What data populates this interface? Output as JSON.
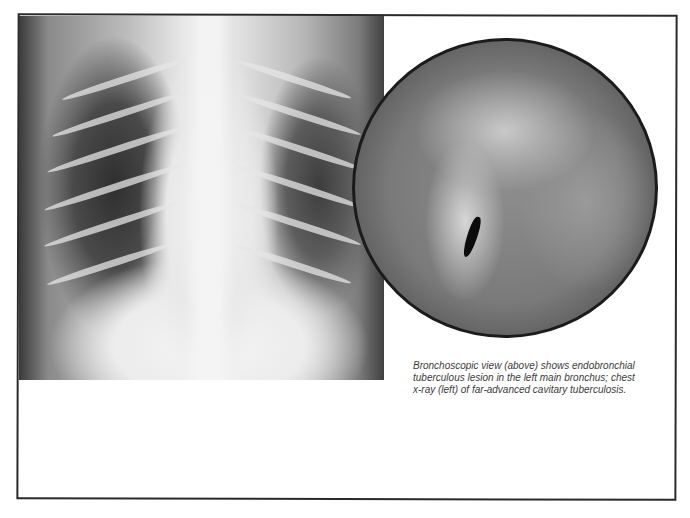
{
  "figure": {
    "left_image": {
      "label": "chest x-ray",
      "description": "Frontal chest radiograph showing far-advanced cavitary tuberculosis"
    },
    "right_image": {
      "label": "bronchoscopic view",
      "description": "Circular bronchoscopic view of endobronchial tuberculous lesion"
    },
    "caption": "Bronchoscopic view (above) shows endobronchial tuberculous lesion in the left main bronchus; chest x-ray (left) of far-advanced cavitary tuberculosis."
  }
}
